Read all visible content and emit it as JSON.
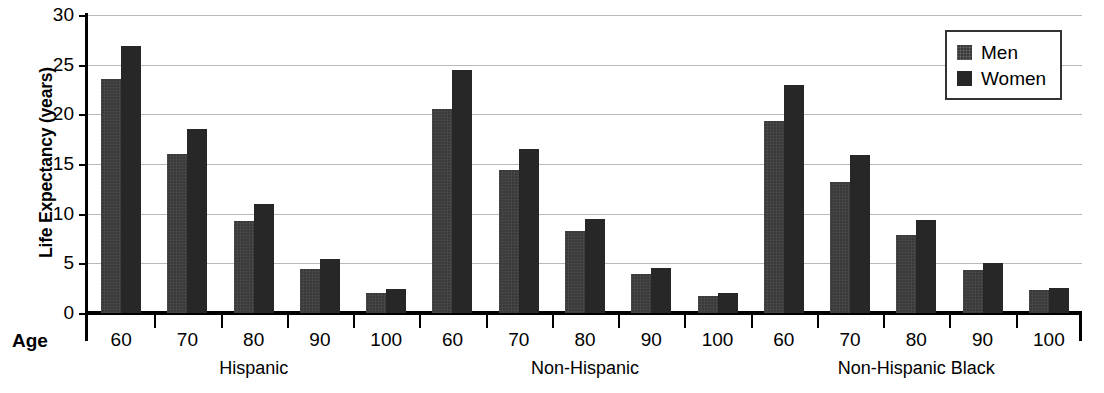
{
  "chart_data": {
    "type": "bar",
    "title": "",
    "xlabel": "Age",
    "ylabel": "Life Expectancy (years)",
    "ylim": [
      0,
      30
    ],
    "ytick_values": [
      0,
      5,
      10,
      15,
      20,
      25,
      30
    ],
    "ytick_labels": [
      "0",
      "5",
      "10",
      "15",
      "20",
      "25",
      "30"
    ],
    "grid": true,
    "grid_axis": "y",
    "legend_position": "top-right",
    "legend": [
      "Men",
      "Women"
    ],
    "group_labels": [
      "Hispanic",
      "Non-Hispanic",
      "Non-Hispanic Black"
    ],
    "categories": [
      "60",
      "70",
      "80",
      "90",
      "100"
    ],
    "groups": [
      {
        "name": "Hispanic",
        "categories": [
          "60",
          "70",
          "80",
          "90",
          "100"
        ],
        "series": [
          {
            "name": "Men",
            "values": [
              23.6,
              16.0,
              9.3,
              4.4,
              2.0
            ]
          },
          {
            "name": "Women",
            "values": [
              26.9,
              18.5,
              11.0,
              5.4,
              2.4
            ]
          }
        ]
      },
      {
        "name": "Non-Hispanic",
        "categories": [
          "60",
          "70",
          "80",
          "90",
          "100"
        ],
        "series": [
          {
            "name": "Men",
            "values": [
              20.5,
              14.4,
              8.3,
              3.9,
              1.7
            ]
          },
          {
            "name": "Women",
            "values": [
              24.5,
              16.5,
              9.5,
              4.5,
              2.0
            ]
          }
        ]
      },
      {
        "name": "Non-Hispanic Black",
        "categories": [
          "60",
          "70",
          "80",
          "90",
          "100"
        ],
        "series": [
          {
            "name": "Men",
            "values": [
              19.3,
              13.2,
              7.9,
              4.3,
              2.3
            ]
          },
          {
            "name": "Women",
            "values": [
              23.0,
              15.9,
              9.4,
              5.0,
              2.5
            ]
          }
        ]
      }
    ],
    "colors": {
      "men": "#3a3a3a",
      "women": "#272727",
      "grid": "#b9b9b9",
      "axis": "#000000",
      "background": "#ffffff"
    }
  }
}
